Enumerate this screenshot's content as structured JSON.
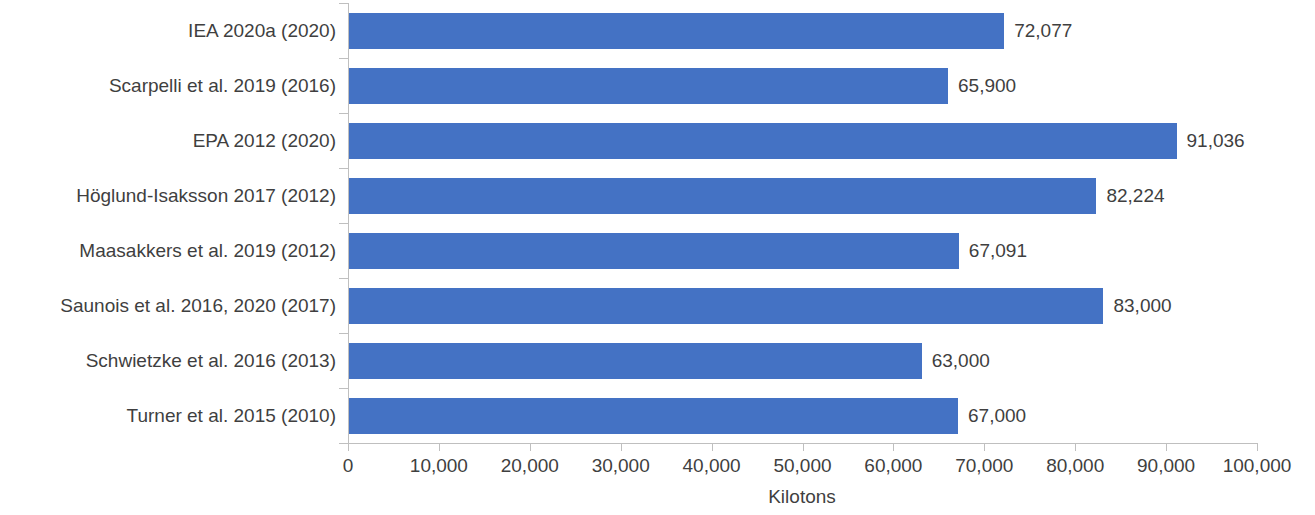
{
  "chart_data": {
    "type": "bar",
    "orientation": "horizontal",
    "title": "",
    "subtitle": "",
    "xlabel": "Kilotons",
    "ylabel": "",
    "xlim": [
      0,
      100000
    ],
    "ylim": null,
    "grid": false,
    "legend": null,
    "legend_position": "none",
    "bar_color": "#4472C4",
    "axis_color": "#BFBFBF",
    "text_color": "#3F3F3F",
    "categories": [
      "IEA 2020a (2020)",
      "Scarpelli et al. 2019 (2016)",
      "EPA 2012 (2020)",
      "Höglund-Isaksson 2017 (2012)",
      "Maasakkers et al. 2019 (2012)",
      "Saunois et al. 2016, 2020 (2017)",
      "Schwietzke et al. 2016 (2013)",
      "Turner et al. 2015 (2010)"
    ],
    "values": [
      72077,
      65900,
      91036,
      82224,
      67091,
      83000,
      63000,
      67000
    ],
    "data_labels": [
      "72,077",
      "65,900",
      "91,036",
      "82,224",
      "67,091",
      "83,000",
      "63,000",
      "67,000"
    ],
    "xticks": [
      0,
      10000,
      20000,
      30000,
      40000,
      50000,
      60000,
      70000,
      80000,
      90000,
      100000
    ],
    "xtick_labels": [
      "0",
      "10,000",
      "20,000",
      "30,000",
      "40,000",
      "50,000",
      "60,000",
      "70,000",
      "80,000",
      "90,000",
      "100,000"
    ]
  }
}
